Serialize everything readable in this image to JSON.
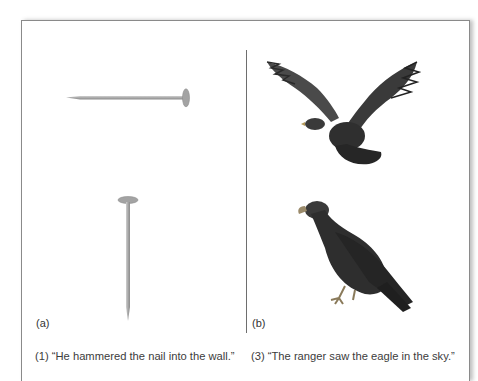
{
  "figure": {
    "panels": [
      {
        "id": "a",
        "label": "(a)",
        "images": [
          "nail-horizontal",
          "nail-vertical"
        ],
        "caption": "(1) “He hammered the nail into the wall.”"
      },
      {
        "id": "b",
        "label": "(b)",
        "images": [
          "eagle-flying",
          "eagle-perched"
        ],
        "caption": "(3) “The ranger saw the eagle in the sky.”"
      }
    ],
    "colors": {
      "border": "#8a8a8a",
      "divider": "#6e6e6e",
      "nail": "#a9a9a9",
      "eagle": "#2e2e2e"
    }
  }
}
